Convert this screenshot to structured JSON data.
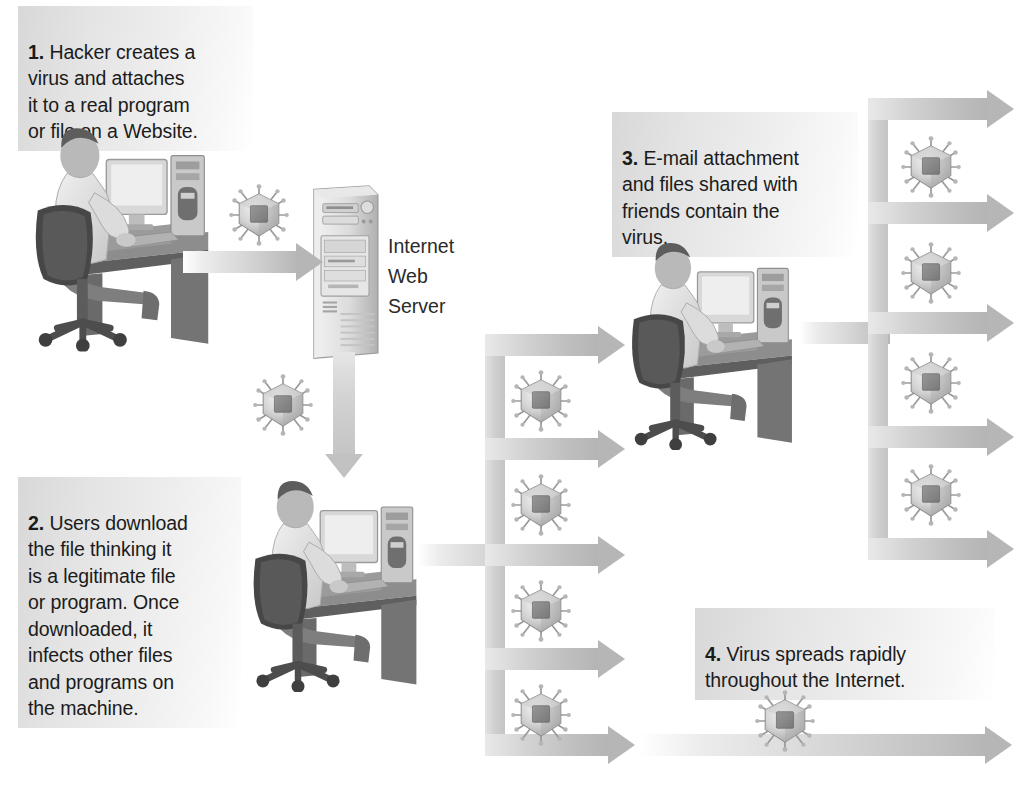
{
  "diagram": {
    "title_semantics": "how-a-computer-virus-spreads",
    "background_color": "#ffffff",
    "arrow_color": "#bfbfbf",
    "text_color": "#1b1b1b",
    "callout_bg_color": "#e2e2e2"
  },
  "steps": [
    {
      "number": "1.",
      "text": " Hacker creates a\nvirus and attaches\nit to a real program\nor file on a Website."
    },
    {
      "number": "2.",
      "text": " Users download\nthe file thinking it\nis a legitimate file\nor program. Once\ndownloaded, it\ninfects other files\nand programs on\nthe machine."
    },
    {
      "number": "3.",
      "text": " E-mail attachment\nand files shared with\nfriends contain the\nvirus."
    },
    {
      "number": "4.",
      "text": " Virus spreads rapidly\nthroughout the Internet."
    }
  ],
  "labels": {
    "server": "Internet\nWeb\nServer"
  },
  "icons": {
    "virus": "virus-icon",
    "server": "tower-server-icon",
    "workstation": "person-at-computer-icon",
    "arrow_right": "arrow-right-icon",
    "arrow_down": "arrow-down-icon"
  },
  "counts": {
    "viruses_total": 13,
    "middle_branch_arrows": 4,
    "right_branch_arrows": 5
  }
}
